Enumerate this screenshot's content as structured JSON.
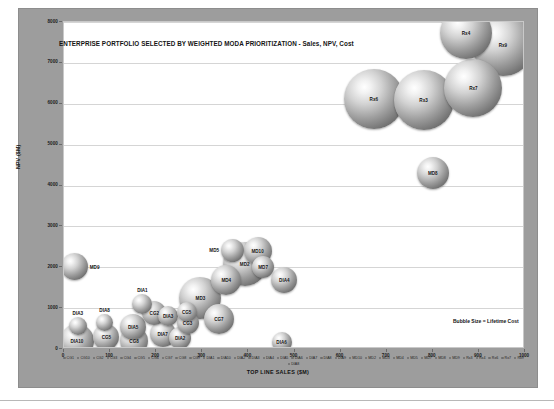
{
  "chart_data": {
    "type": "scatter",
    "title": "ENTERPRISE PORTFOLIO SELECTED BY WEIGHTED MODA PRIORITIZATION - Sales, NPV, Cost",
    "xlabel": "TOP LINE SALES ($M)",
    "ylabel": "NPV ($M)",
    "xlim": [
      0,
      1000
    ],
    "ylim": [
      0,
      8000
    ],
    "xticks": [
      "0",
      "100",
      "200",
      "300",
      "400",
      "500",
      "600",
      "700",
      "800",
      "900",
      "1000"
    ],
    "yticks": [
      "0",
      "1000",
      "2000",
      "3000",
      "4000",
      "5000",
      "6000",
      "7000",
      "8000"
    ],
    "grid": true,
    "legend_position": "bottom",
    "annotation": "Bubble Size = Lifetime Cost",
    "size_meaning": "Lifetime Cost",
    "points": [
      {
        "label": "DIA10",
        "x": 28,
        "y": 190,
        "size": 34
      },
      {
        "label": "DIA3",
        "x": 30,
        "y": 560,
        "size": 18
      },
      {
        "label": "MD9",
        "x": 22,
        "y": 2010,
        "size": 27
      },
      {
        "label": "CG5",
        "x": 92,
        "y": 300,
        "size": 26
      },
      {
        "label": "DIA8",
        "x": 88,
        "y": 640,
        "size": 17
      },
      {
        "label": "CG8",
        "x": 152,
        "y": 190,
        "size": 28
      },
      {
        "label": "DIA5",
        "x": 150,
        "y": 530,
        "size": 26
      },
      {
        "label": "DIA1",
        "x": 170,
        "y": 1090,
        "size": 20
      },
      {
        "label": "CG2",
        "x": 196,
        "y": 880,
        "size": 24
      },
      {
        "label": "DIA7",
        "x": 214,
        "y": 370,
        "size": 26
      },
      {
        "label": "DIA3b",
        "x": 226,
        "y": 800,
        "size": 20
      },
      {
        "label": "DIA2",
        "x": 252,
        "y": 260,
        "size": 22
      },
      {
        "label": "CG3",
        "x": 268,
        "y": 640,
        "size": 22
      },
      {
        "label": "CG5b",
        "x": 266,
        "y": 900,
        "size": 20
      },
      {
        "label": "MD3",
        "x": 296,
        "y": 1240,
        "size": 42
      },
      {
        "label": "CG7",
        "x": 336,
        "y": 730,
        "size": 30
      },
      {
        "label": "MD4",
        "x": 352,
        "y": 1690,
        "size": 30
      },
      {
        "label": "MD5",
        "x": 366,
        "y": 2410,
        "size": 23
      },
      {
        "label": "MD2",
        "x": 392,
        "y": 2090,
        "size": 44
      },
      {
        "label": "MD10",
        "x": 420,
        "y": 2400,
        "size": 28
      },
      {
        "label": "MD7",
        "x": 432,
        "y": 2000,
        "size": 22
      },
      {
        "label": "DIA4",
        "x": 478,
        "y": 1680,
        "size": 26
      },
      {
        "label": "DIA6",
        "x": 472,
        "y": 160,
        "size": 20
      },
      {
        "label": "MD8",
        "x": 800,
        "y": 4300,
        "size": 32
      },
      {
        "label": "Rx6",
        "x": 672,
        "y": 6120,
        "size": 60
      },
      {
        "label": "Rx3",
        "x": 780,
        "y": 6100,
        "size": 60
      },
      {
        "label": "Rx7",
        "x": 888,
        "y": 6390,
        "size": 58
      },
      {
        "label": "Rx4",
        "x": 872,
        "y": 7740,
        "size": 52
      },
      {
        "label": "Rx9",
        "x": 952,
        "y": 7430,
        "size": 62
      }
    ]
  },
  "legend": {
    "items": [
      "CG1",
      "CG10",
      "CG2",
      "CG3",
      "CG4",
      "CG5",
      "CG6",
      "CG7",
      "CG8",
      "CG9",
      "DIA1",
      "DIA10",
      "DIA2",
      "DIA3",
      "DIA4",
      "DIA5",
      "DIA6",
      "DIA7",
      "DIA8",
      "DIA9",
      "MD10",
      "MD2",
      "MD3",
      "MD4",
      "MD5",
      "MD7",
      "MD8",
      "MD9",
      "Rx3",
      "Rx4",
      "Rx6",
      "Rx7",
      "Rx9",
      "DIA8"
    ]
  }
}
